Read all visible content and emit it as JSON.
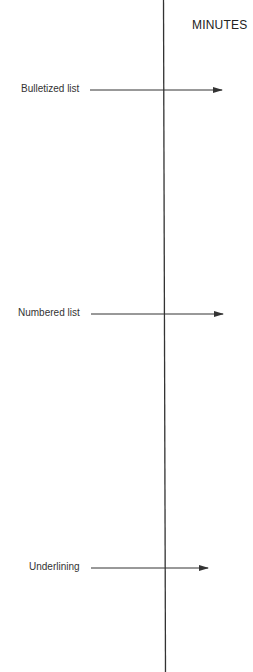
{
  "axis": {
    "title": "MINUTES"
  },
  "rows": [
    {
      "label": "Bulletized list",
      "y": 90,
      "arrow_end": 222
    },
    {
      "label": "Numbered list",
      "y": 314,
      "arrow_end": 223
    },
    {
      "label": "Underlining",
      "y": 568,
      "arrow_end": 208
    }
  ],
  "colors": {
    "line": "#333333",
    "text": "#333333"
  }
}
